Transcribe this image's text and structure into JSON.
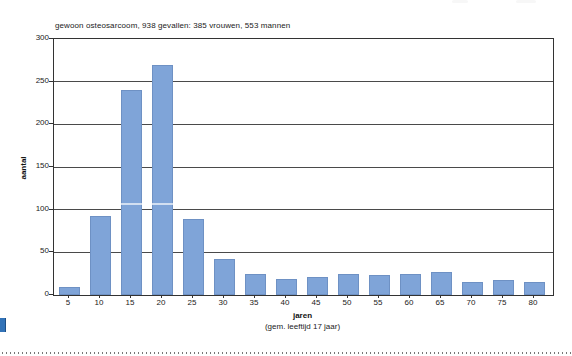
{
  "chart_data": {
    "type": "bar",
    "title": "gewoon osteosarcoom, 938 gevallen: 385 vrouwen, 553 mannen",
    "ylabel": "aantal",
    "xlabel": "jaren",
    "xlabel_note": "(gem. leeftijd 17 jaar)",
    "categories": [
      "5",
      "10",
      "15",
      "20",
      "25",
      "30",
      "35",
      "40",
      "45",
      "50",
      "55",
      "60",
      "65",
      "70",
      "75",
      "80"
    ],
    "values": [
      9,
      92,
      240,
      270,
      89,
      42,
      25,
      19,
      21,
      25,
      24,
      25,
      27,
      15,
      17,
      15
    ],
    "ylim": [
      0,
      300
    ],
    "ytick_step": 50,
    "yticks": [
      "0",
      "50",
      "100",
      "150",
      "200",
      "250",
      "300"
    ],
    "grid": true,
    "legend": "none",
    "bar_color": "#7fa4d8",
    "gridline_color": "#4a4a4a"
  },
  "decorations": {
    "corner_marker_color": "#3273b8",
    "divider_style": "dotted"
  }
}
